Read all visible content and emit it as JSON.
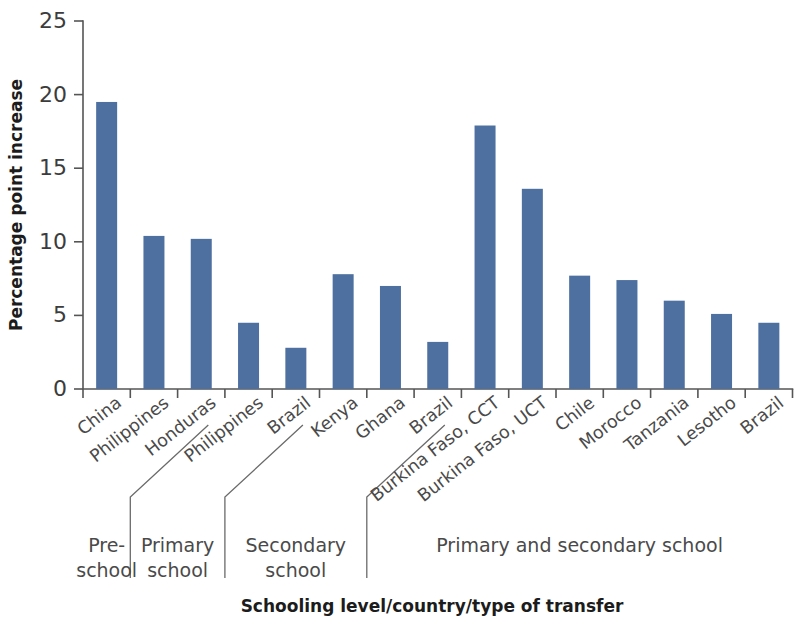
{
  "chart_data": {
    "type": "bar",
    "title": "",
    "xlabel": "Schooling level/country/type of transfer",
    "ylabel": "Percentage point increase",
    "ylim": [
      0,
      25
    ],
    "yticks": [
      0,
      5,
      10,
      15,
      20,
      25
    ],
    "grid": false,
    "legend": null,
    "bar_color": "#4d70a0",
    "categories": [
      "China",
      "Philippines",
      "Honduras",
      "Philippines",
      "Brazil",
      "Kenya",
      "Ghana",
      "Brazil",
      "Burkina Faso, CCT",
      "Burkina Faso, UCT",
      "Chile",
      "Morocco",
      "Tanzania",
      "Lesotho",
      "Brazil"
    ],
    "values": [
      19.5,
      10.4,
      10.2,
      4.5,
      2.8,
      7.8,
      7.0,
      3.2,
      17.9,
      13.6,
      7.7,
      7.4,
      6.0,
      5.1,
      4.5
    ],
    "groups": [
      {
        "label_lines": [
          "Pre-",
          "school"
        ],
        "start_index": 0,
        "end_index": 0
      },
      {
        "label_lines": [
          "Primary",
          "school"
        ],
        "start_index": 1,
        "end_index": 2
      },
      {
        "label_lines": [
          "Secondary",
          "school"
        ],
        "start_index": 3,
        "end_index": 5
      },
      {
        "label_lines": [
          "Primary and secondary school"
        ],
        "start_index": 6,
        "end_index": 14
      }
    ]
  }
}
